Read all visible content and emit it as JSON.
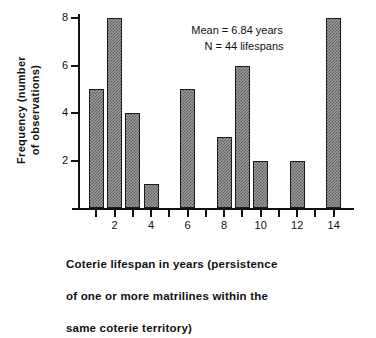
{
  "chart_data": {
    "type": "bar",
    "title": "",
    "xlabel": "Coterie lifespan in years (persistence of one or more matrilines within the same coterie territory)",
    "ylabel": "Frequency (number of observations)",
    "categories": [
      1,
      2,
      3,
      4,
      5,
      6,
      7,
      8,
      9,
      10,
      11,
      12,
      13,
      14
    ],
    "values": [
      5,
      8,
      4,
      1,
      0,
      5,
      0,
      3,
      6,
      2,
      0,
      2,
      0,
      8
    ],
    "xlim": [
      0,
      15
    ],
    "ylim": [
      0,
      8
    ],
    "xticks": [
      1,
      2,
      3,
      4,
      5,
      6,
      7,
      8,
      9,
      10,
      11,
      12,
      13,
      14
    ],
    "xtick_labels_shown": [
      2,
      4,
      6,
      8,
      10,
      12,
      14
    ],
    "yticks": [
      2,
      4,
      6,
      8
    ],
    "grid": false,
    "legend": null,
    "bar_color": "#8c8c8c",
    "bar_edge_color": "#1a1a1a",
    "annotations": [
      "Mean = 6.84 years",
      "N = 44 lifespans"
    ]
  },
  "axes": {
    "y_title": "Frequency  (number\nof  observations)",
    "y_tick_labels": [
      "2",
      "4",
      "6",
      "8"
    ],
    "x_tick_labels": [
      "2",
      "4",
      "6",
      "8",
      "10",
      "12",
      "14"
    ]
  },
  "annotation": {
    "line1": "Mean = 6.84 years",
    "line2": "N = 44 lifespans"
  },
  "caption": {
    "line1": "Coterie   lifespan   in   years   (persistence",
    "line2": "of  one  or  more  matrilines  within  the",
    "line3": "same   coterie   territory)"
  }
}
